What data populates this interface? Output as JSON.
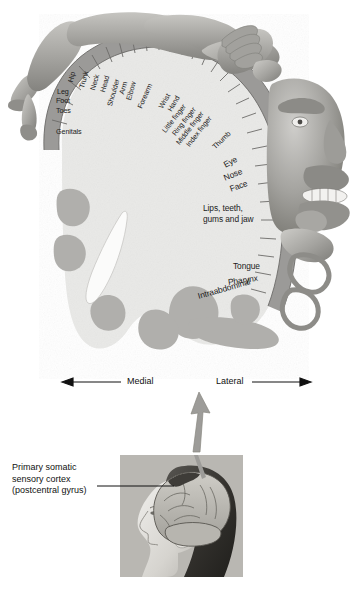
{
  "figure": {
    "type": "anatomical-diagram"
  },
  "colors": {
    "cortex_strip": "#9b9a98",
    "strip_divider": "#6e6d6b",
    "brain_tissue": "#e9e9e7",
    "gyri_gray": "#b0afac",
    "homunculus": "#a9a8a4",
    "homunculus_shadow": "#8b8a86",
    "text": "#1b1b1b",
    "arrow": "#9d9c99",
    "inset_bg": "#b9b7b2",
    "page_bg": "#ffffff"
  },
  "cortex_labels": [
    {
      "text": "Hip",
      "x": 71,
      "y": 78,
      "rot": -76
    },
    {
      "text": "Leg",
      "x": 57,
      "y": 91,
      "rot": 0
    },
    {
      "text": "Foot",
      "x": 56,
      "y": 100,
      "rot": 0
    },
    {
      "text": "Toes",
      "x": 56,
      "y": 110,
      "rot": 0
    },
    {
      "text": "Genitals",
      "x": 56,
      "y": 131,
      "rot": 0
    },
    {
      "text": "Trunk",
      "x": 84,
      "y": 86,
      "rot": -74
    },
    {
      "text": "Neck",
      "x": 95,
      "y": 88,
      "rot": -74
    },
    {
      "text": "Head",
      "x": 105,
      "y": 90,
      "rot": -74
    },
    {
      "text": "Shoulder",
      "x": 112,
      "y": 103,
      "rot": -74
    },
    {
      "text": "Arm",
      "x": 124,
      "y": 91,
      "rot": -74
    },
    {
      "text": "Elbow",
      "x": 131,
      "y": 96,
      "rot": -74
    },
    {
      "text": "Forearm",
      "x": 142,
      "y": 104,
      "rot": -66
    },
    {
      "text": "Wrist",
      "x": 163,
      "y": 104,
      "rot": -60
    },
    {
      "text": "Hand",
      "x": 172,
      "y": 107,
      "rot": -60
    },
    {
      "text": "Little finger",
      "x": 166,
      "y": 128,
      "rot": -52
    },
    {
      "text": "Ring finger",
      "x": 176,
      "y": 131,
      "rot": -52
    },
    {
      "text": "Middle finger",
      "x": 180,
      "y": 140,
      "rot": -52
    },
    {
      "text": "Index finger",
      "x": 190,
      "y": 142,
      "rot": -52
    },
    {
      "text": "Thumb",
      "x": 216,
      "y": 144,
      "rot": -44
    },
    {
      "text": "Eye",
      "x": 226,
      "y": 160,
      "rot": -28
    },
    {
      "text": "Nose",
      "x": 226,
      "y": 173,
      "rot": -22
    },
    {
      "text": "Face",
      "x": 231,
      "y": 184,
      "rot": -20
    }
  ],
  "cortex_labels_multiline": [
    {
      "line1": "Lips, teeth,",
      "line2": "gums and jaw",
      "x": 207,
      "y": 206
    }
  ],
  "cortex_labels_lower": [
    {
      "text": "Tongue",
      "x": 236,
      "y": 263,
      "rot": 0
    },
    {
      "text": "Pharynx",
      "x": 231,
      "y": 280,
      "rot": -8
    },
    {
      "text": "Intraabdominal",
      "x": 201,
      "y": 295,
      "rot": -16
    }
  ],
  "orientation": {
    "medial_label": "Medial",
    "lateral_label": "Lateral",
    "medial_x": 127,
    "lateral_x": 218,
    "y": 382
  },
  "callout": {
    "line1": "Primary somatic",
    "line2": "sensory cortex",
    "line3": "(postcentral gyrus)",
    "x": 12,
    "y": 462
  },
  "inset": {
    "name": "head-profile-with-brain",
    "description": "Lateral view of a woman's head showing the brain and postcentral gyrus",
    "x": 120,
    "y": 455,
    "width": 123,
    "height": 122
  },
  "connector_arrow": {
    "name": "inset-to-diagram-arrow",
    "direction": "up",
    "from_y": 452,
    "to_y": 392
  }
}
